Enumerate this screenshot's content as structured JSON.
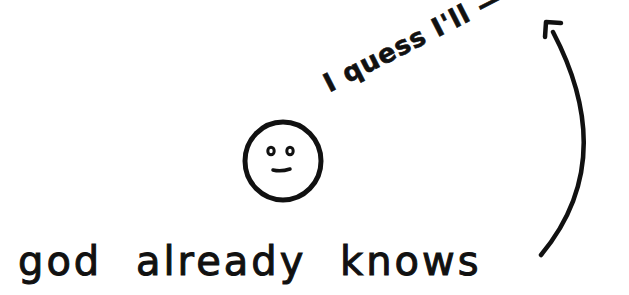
{
  "comic": {
    "speech_text": "I quess I'll —",
    "caption_text": "god already knows",
    "character": {
      "expression": "neutral-smile-face",
      "eyes": 2,
      "mouth": "small-line"
    },
    "arrow": {
      "direction": "from caption end curving up to top-right",
      "icon": "curved-arrow-icon"
    },
    "colors": {
      "background": "#ffffff",
      "ink": "#111111"
    }
  }
}
